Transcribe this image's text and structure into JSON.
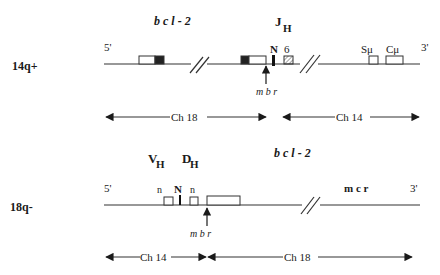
{
  "diagram": {
    "panel_top": {
      "chromosome_label": "14q+",
      "five_prime": "5'",
      "three_prime": "3'",
      "gene_label": "b c l - 2",
      "jh_label": "J",
      "jh_sub": "H",
      "n_label": "N",
      "jh_segment": "6",
      "s_mu": "Sμ",
      "c_mu": "Cμ",
      "breakpoint_label": "m b r",
      "span_left": "Ch  18",
      "span_right": "Ch  14"
    },
    "panel_bottom": {
      "chromosome_label": "18q-",
      "five_prime": "5'",
      "three_prime": "3'",
      "vh_label": "V",
      "vh_sub": "H",
      "dh_label": "D",
      "dh_sub": "H",
      "n_left": "n",
      "n_mid": "N",
      "n_right": "n",
      "gene_label": "b c l - 2",
      "mcr_label": "m c r",
      "breakpoint_label": "m b r",
      "span_left": "Ch  14",
      "span_right": "Ch  18"
    },
    "colors": {
      "line": "#333333",
      "exon_dark": "#222222",
      "background": "#ffffff"
    }
  }
}
